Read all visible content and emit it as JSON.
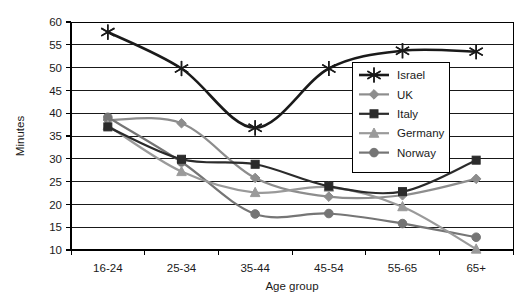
{
  "chart_data": {
    "type": "line",
    "title": "",
    "xlabel": "Age group",
    "ylabel": "Minutes",
    "categories": [
      "16-24",
      "25-34",
      "35-44",
      "45-54",
      "55-65",
      "65+"
    ],
    "ylim": [
      10,
      60
    ],
    "ytick_step": 5,
    "yticks": [
      10,
      15,
      20,
      25,
      30,
      35,
      40,
      45,
      50,
      55,
      60
    ],
    "grid": "horizontal",
    "smoothed": true,
    "legend_position": "inside-right-upper",
    "series": [
      {
        "name": "Israel",
        "marker": "star",
        "color": "#1a1a1a",
        "values": [
          57.8,
          49.8,
          36.8,
          49.8,
          53.7,
          53.5
        ]
      },
      {
        "name": "UK",
        "marker": "diamond",
        "color": "#8d8d8d",
        "values": [
          38.5,
          37.8,
          25.8,
          21.7,
          22.0,
          25.6
        ]
      },
      {
        "name": "Italy",
        "marker": "square",
        "color": "#2b2b2b",
        "values": [
          37.0,
          29.9,
          28.8,
          24.0,
          22.8,
          29.7
        ]
      },
      {
        "name": "Germany",
        "marker": "triangle",
        "color": "#9a9a9a",
        "values": [
          37.3,
          27.2,
          22.6,
          23.8,
          19.5,
          10.2
        ]
      },
      {
        "name": "Norway",
        "marker": "circle",
        "color": "#757575",
        "values": [
          39.1,
          29.3,
          17.9,
          18.0,
          15.8,
          12.8
        ]
      }
    ]
  },
  "axis": {
    "y_title": "Minutes",
    "x_title": "Age group"
  },
  "legend": {
    "entries": [
      "Israel",
      "UK",
      "Italy",
      "Germany",
      "Norway"
    ]
  }
}
